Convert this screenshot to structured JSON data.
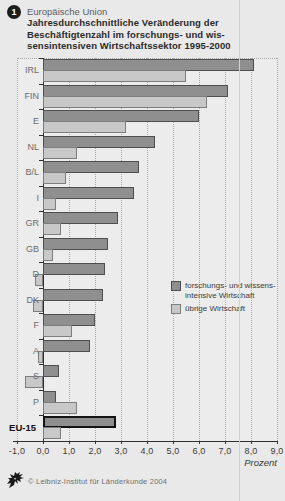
{
  "page": {
    "badge": "1",
    "kicker": "Europäische Union",
    "title_lines": [
      "Jahresdurchschnittliche Veränderung der",
      "Beschäftigtenzahl im forschungs- und wis-",
      "sensintensiven Wirtschaftssektor 1995-2000"
    ]
  },
  "chart_data": {
    "type": "bar",
    "orientation": "horizontal",
    "categories": [
      "IRL",
      "FIN",
      "E",
      "NL",
      "B/L",
      "I",
      "GR",
      "GB",
      "D",
      "DK",
      "F",
      "A",
      "S",
      "P",
      "EU-15"
    ],
    "series": [
      {
        "name": "forschungs- und wissensintensive Wirtschaft",
        "color": "#8f8f8f",
        "values": [
          8.1,
          7.1,
          6.0,
          4.3,
          3.7,
          3.5,
          2.9,
          2.5,
          2.4,
          2.3,
          2.0,
          1.8,
          0.6,
          0.5,
          2.8
        ]
      },
      {
        "name": "übrige Wirtschaft",
        "color": "#c8c8c8",
        "values": [
          5.5,
          6.3,
          3.2,
          1.3,
          0.9,
          0.5,
          0.7,
          0.4,
          -0.3,
          -0.4,
          1.1,
          -0.2,
          -0.7,
          1.3,
          0.7
        ]
      }
    ],
    "highlight_category": "EU-15",
    "xlim": [
      -1.0,
      9.0
    ],
    "x_ticks": [
      "-1,0",
      "0,0",
      "1,0",
      "2,0",
      "3,0",
      "4,0",
      "5,0",
      "6,0",
      "7,0",
      "8,0",
      "9,0"
    ],
    "xlabel": "Prozent",
    "grid": "vertical dotted gridlines every 1.0",
    "legend_position": "center-right"
  },
  "legend": {
    "series1_line1": "forschungs- und wissens-",
    "series1_line2": "intensive Wirtschaft",
    "series2_label": "übrige Wirtschaft"
  },
  "footer": {
    "copyright": "© Leibniz-Institut für Länderkunde 2004"
  },
  "colors": {
    "background": "#e9e9e9",
    "bar_dark": "#8f8f8f",
    "bar_dark_border": "#4e4e4e",
    "bar_light": "#c8c8c8",
    "bar_light_border": "#7d7d7d",
    "highlight_border": "#141414",
    "axis": "#2f2f2f"
  }
}
